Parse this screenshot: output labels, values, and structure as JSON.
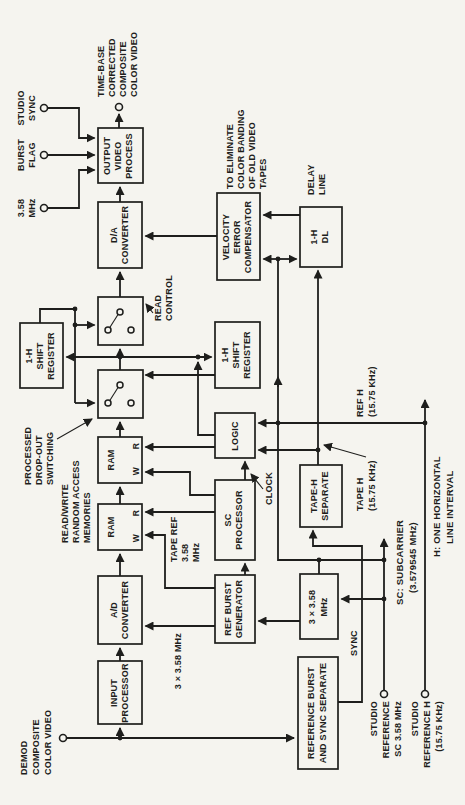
{
  "colors": {
    "paper": "#f5f4ef",
    "ink": "#1e1e1c"
  },
  "blocks": {
    "input_processor": [
      "INPUT",
      "PROCESSOR"
    ],
    "ad_converter": [
      "A/D",
      "CONVERTER"
    ],
    "ram1": [
      "RAM",
      "W",
      "R"
    ],
    "ram2": [
      "RAM",
      "W",
      "R"
    ],
    "da_converter": [
      "D/A",
      "CONVERTER"
    ],
    "output_video_process": [
      "OUTPUT",
      "VIDEO",
      "PROCESS"
    ],
    "shift_register_top": [
      "1-H",
      "SHIFT",
      "REGISTER"
    ],
    "ref_burst_generator": [
      "REF BURST",
      "GENERATOR"
    ],
    "sc_processor": [
      "SC",
      "PROCESSOR"
    ],
    "logic": [
      "LOGIC"
    ],
    "shift_register_bottom": [
      "1-H",
      "SHIFT",
      "REGISTER"
    ],
    "velocity_error_compensator": [
      "VELOCITY",
      "ERROR",
      "COMPENSATOR"
    ],
    "reference_burst_sync_separate": [
      "REFERENCE BURST",
      "AND SYNC SEPARATE"
    ],
    "mult_3x358": [
      "3 × 3.58",
      "MHz"
    ],
    "tape_h_separate": [
      "TAPE-H",
      "SEPARATE"
    ],
    "delay_line_1h": [
      "1-H",
      "DL"
    ]
  },
  "terminals": {
    "demod": [
      "DEMOD",
      "COMPOSITE",
      "COLOR VIDEO"
    ],
    "in_358": [
      "3.58",
      "MHz"
    ],
    "burst_flag": [
      "BURST",
      "FLAG"
    ],
    "studio_sync": [
      "STUDIO",
      "SYNC"
    ],
    "output": [
      "TIME-BASE",
      "CORRECTED",
      "COMPOSITE",
      "COLOR VIDEO"
    ],
    "studio_ref_sc": [
      "STUDIO",
      "REFERENCE",
      "SC 3.58 MHz"
    ],
    "studio_ref_h": [
      "STUDIO",
      "REFERENCE H",
      "(15.75 KHz)"
    ]
  },
  "annotations": {
    "rw_ram": [
      "READ/WRITE",
      "RANDOM ACCESS",
      "MEMORIES"
    ],
    "processed": [
      "PROCESSED",
      "DROP-OUT",
      "SWITCHING"
    ],
    "read_control": [
      "READ",
      "CONTROL"
    ],
    "tape_ref": [
      "TAPE REF",
      "3.58",
      "MHz"
    ],
    "mult_clock": "3 × 3.58 MHz",
    "clock": "CLOCK",
    "tape_h": [
      "TAPE H",
      "(15.75 KHz)"
    ],
    "ref_h": [
      "REF H",
      "(15.75 KHz)"
    ],
    "delay_line": [
      "DELAY",
      "LINE"
    ],
    "eliminate": [
      "TO ELIMINATE",
      "COLOR BANDING",
      "OF OLD VIDEO",
      "TAPES"
    ],
    "sync": "SYNC",
    "sc_note": [
      "SC: SUBCARRIER",
      "(3.579545 MHz)"
    ],
    "h_note": [
      "H: ONE HORIZONTAL",
      "LINE INTERVAL"
    ]
  }
}
